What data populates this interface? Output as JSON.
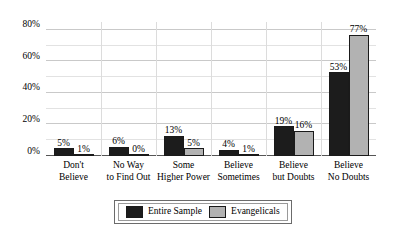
{
  "chart_data": {
    "type": "bar",
    "title": "",
    "subtitle": "",
    "xlabel": "",
    "ylabel": "",
    "ylim": [
      0,
      85
    ],
    "grid": true,
    "legend_position": "bottom",
    "y_ticks": [
      "0%",
      "20%",
      "40%",
      "60%",
      "80%"
    ],
    "y_tick_values": [
      0,
      20,
      40,
      60,
      80
    ],
    "y_minor_tick_values": [
      10,
      30,
      50,
      70
    ],
    "categories": [
      "Don't Believe",
      "No Way to Find Out",
      "Some Higher Power",
      "Believe Sometimes",
      "Believe but Doubts",
      "Believe No Doubts"
    ],
    "category_lines": [
      [
        "Don't",
        "Believe"
      ],
      [
        "No Way",
        "to Find Out"
      ],
      [
        "Some",
        "Higher Power"
      ],
      [
        "Believe",
        "Sometimes"
      ],
      [
        "Believe",
        "but Doubts"
      ],
      [
        "Believe",
        "No Doubts"
      ]
    ],
    "series": [
      {
        "name": "Entire Sample",
        "color": "#1c1c1c",
        "values": [
          5,
          6,
          13,
          4,
          19,
          53
        ],
        "labels": [
          "5%",
          "6%",
          "13%",
          "4%",
          "19%",
          "53%"
        ]
      },
      {
        "name": "Evangelicals",
        "color": "#b2b2b2",
        "values": [
          1,
          0,
          5,
          1,
          16,
          77
        ],
        "labels": [
          "1%",
          "0%",
          "5%",
          "1%",
          "16%",
          "77%"
        ]
      }
    ]
  },
  "legend": {
    "items": [
      {
        "label": "Entire Sample",
        "color": "#1c1c1c"
      },
      {
        "label": "Evangelicals",
        "color": "#b2b2b2"
      }
    ]
  },
  "colors": {
    "series_dark": "#1c1c1c",
    "series_light": "#b2b2b2",
    "gridline": "#c9c9c9",
    "gridline_minor": "#e2e2e2",
    "background": "#ffffff",
    "text": "#000000"
  }
}
